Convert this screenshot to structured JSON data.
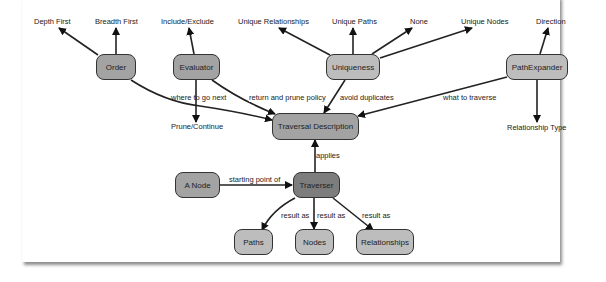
{
  "diagram": {
    "nodes": {
      "order": "Order",
      "evaluator": "Evaluator",
      "uniqueness": "Uniqueness",
      "path_expander": "PathExpander",
      "traversal_description": "Traversal Description",
      "a_node": "A Node",
      "traverser": "Traverser",
      "paths": "Paths",
      "nodes": "Nodes",
      "relationships": "Relationships"
    },
    "leaf_labels": {
      "depth_first": "Depth First",
      "breadth_first": "Breadth First",
      "include_exclude": "Include/Exclude",
      "prune_continue": "Prune/Continue",
      "unique_relationships": "Unique Relationships",
      "unique_paths": "Unique Paths",
      "none": "None",
      "unique_nodes": "Unique Nodes",
      "direction": "Direction",
      "relationship_type": "Relationship Type"
    },
    "edge_labels": {
      "where_to_go_next": "where to go next",
      "return_and_prune_policy": "return and prune policy",
      "avoid_duplicates": "avoid duplicates",
      "what_to_traverse": "what to traverse",
      "applies": "applies",
      "starting_point_of": "starting point of",
      "result_as_paths": "result as",
      "result_as_nodes": "result as",
      "result_as_relationships": "result as"
    },
    "colors": {
      "node_light": "#bdbdbd",
      "node_mid": "#a3a3a3",
      "node_dark": "#7d7d7d",
      "stroke": "#222222"
    }
  }
}
